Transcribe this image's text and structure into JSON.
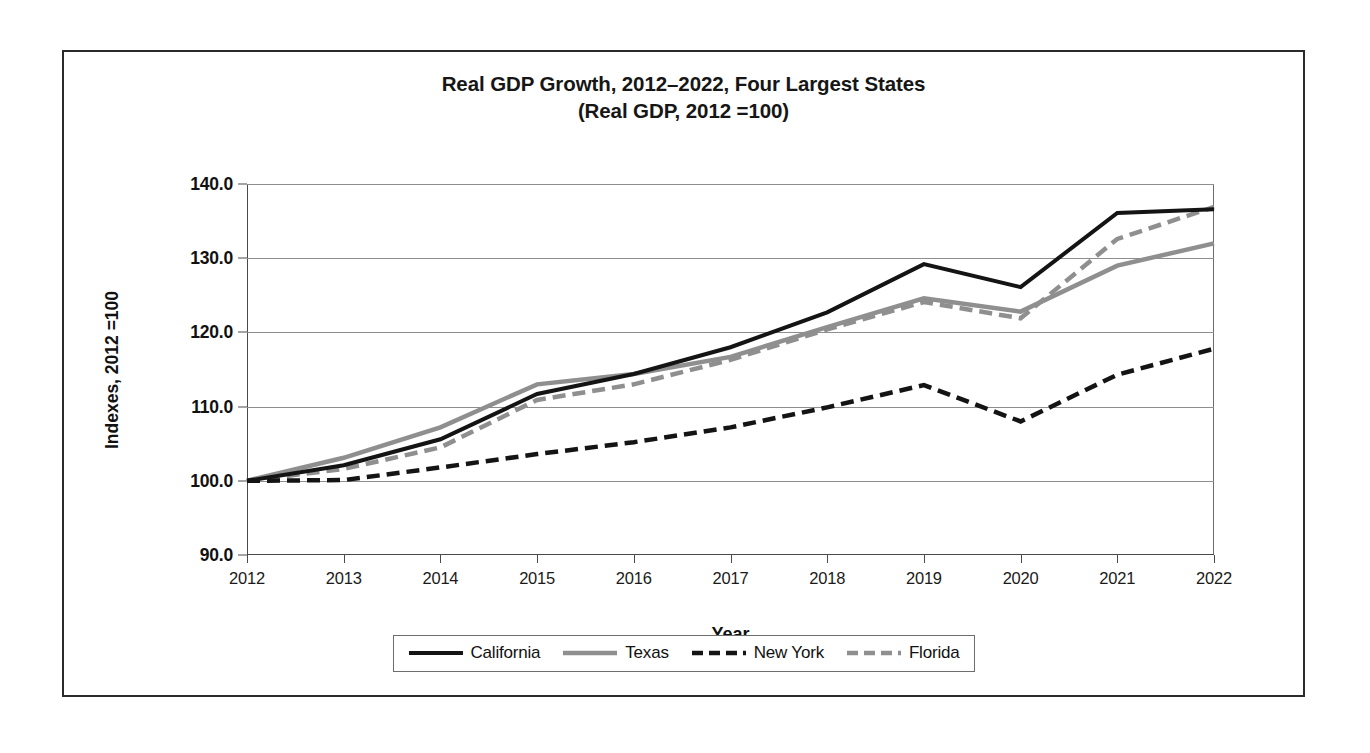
{
  "chart_data": {
    "type": "line",
    "title": "Real GDP Growth, 2012–2022, Four Largest States",
    "subtitle": "(Real GDP, 2012 =100)",
    "xlabel": "Year",
    "ylabel": "Indexes, 2012 =100",
    "x": [
      2012,
      2013,
      2014,
      2015,
      2016,
      2017,
      2018,
      2019,
      2020,
      2021,
      2022
    ],
    "xticklabels": [
      "2012",
      "2013",
      "2014",
      "2015",
      "2016",
      "2017",
      "2018",
      "2019",
      "2020",
      "2021",
      "2022"
    ],
    "yticklabels": [
      "90.0",
      "100.0",
      "110.0",
      "120.0",
      "130.0",
      "140.0"
    ],
    "yticks": [
      90.0,
      100.0,
      110.0,
      120.0,
      130.0,
      140.0
    ],
    "ylim": [
      90.0,
      140.0
    ],
    "xlim": [
      2012,
      2022
    ],
    "grid": "horizontal",
    "legend_position": "bottom",
    "series": [
      {
        "name": "California",
        "style": "solid",
        "color": "#141414",
        "width": 4.0,
        "values": [
          100.0,
          102.1,
          105.6,
          111.7,
          114.4,
          118.0,
          122.7,
          129.2,
          126.1,
          136.1,
          136.6
        ]
      },
      {
        "name": "Texas",
        "style": "solid",
        "color": "#8f8f8f",
        "width": 4.5,
        "values": [
          100.0,
          103.1,
          107.2,
          113.0,
          114.4,
          116.7,
          120.7,
          124.6,
          122.8,
          129.0,
          132.0
        ]
      },
      {
        "name": "New York",
        "style": "dashed",
        "color": "#141414",
        "width": 4.5,
        "values": [
          100.0,
          100.1,
          101.8,
          103.6,
          105.2,
          107.2,
          109.9,
          112.9,
          108.0,
          114.3,
          117.8
        ]
      },
      {
        "name": "Florida",
        "style": "dashed",
        "color": "#8f8f8f",
        "width": 4.5,
        "values": [
          100.0,
          101.6,
          104.5,
          110.9,
          113.0,
          116.3,
          120.4,
          124.1,
          121.9,
          132.6,
          136.9
        ]
      }
    ]
  },
  "legend": {
    "items": [
      {
        "label": "California",
        "swatch": "solid-black-line-swatch"
      },
      {
        "label": "Texas",
        "swatch": "solid-gray-line-swatch"
      },
      {
        "label": "New York",
        "swatch": "dashed-black-line-swatch"
      },
      {
        "label": "Florida",
        "swatch": "dashed-gray-line-swatch"
      }
    ]
  },
  "colors": {
    "california": "#141414",
    "texas": "#8f8f8f",
    "new_york": "#141414",
    "florida": "#8f8f8f",
    "frame": "#2b2b2b",
    "gridline": "#8e8e8e",
    "background": "#ffffff"
  }
}
